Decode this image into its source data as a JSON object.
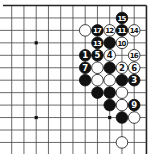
{
  "diagram": {
    "type": "go-board-fragment",
    "corner": "top-right",
    "columns": 12,
    "rows": 12,
    "grid": {
      "x0": 11.7,
      "dx": 12.25,
      "y0": 5.5,
      "dy": 12.45,
      "line_color": "#444444",
      "edge_color": "#222222"
    },
    "star_points": [
      {
        "col": 2,
        "row": 3
      },
      {
        "col": 2,
        "row": 9
      },
      {
        "col": 8,
        "row": 9
      }
    ],
    "stones": [
      {
        "col": 9,
        "row": 1,
        "color": "black",
        "label": "15"
      },
      {
        "col": 6,
        "row": 2,
        "color": "white",
        "label": ""
      },
      {
        "col": 7,
        "row": 2,
        "color": "black",
        "label": "17"
      },
      {
        "col": 8,
        "row": 2,
        "color": "white",
        "label": "12"
      },
      {
        "col": 9,
        "row": 2,
        "color": "black",
        "label": "11"
      },
      {
        "col": 10,
        "row": 2,
        "color": "white",
        "label": "14"
      },
      {
        "col": 7,
        "row": 3,
        "color": "black",
        "label": "13"
      },
      {
        "col": 8,
        "row": 3,
        "color": "black",
        "label": ""
      },
      {
        "col": 9,
        "row": 3,
        "color": "white",
        "label": "10"
      },
      {
        "col": 6,
        "row": 4,
        "color": "black",
        "label": "1"
      },
      {
        "col": 7,
        "row": 4,
        "color": "black",
        "label": "5"
      },
      {
        "col": 8,
        "row": 4,
        "color": "white",
        "label": "4"
      },
      {
        "col": 10,
        "row": 4,
        "color": "white",
        "label": "16"
      },
      {
        "col": 6,
        "row": 5,
        "color": "black",
        "label": "7"
      },
      {
        "col": 7,
        "row": 5,
        "color": "white",
        "label": ""
      },
      {
        "col": 8,
        "row": 5,
        "color": "black",
        "label": ""
      },
      {
        "col": 9,
        "row": 5,
        "color": "white",
        "label": "2"
      },
      {
        "col": 10,
        "row": 5,
        "color": "white",
        "label": "6"
      },
      {
        "col": 6,
        "row": 6,
        "color": "black",
        "label": ""
      },
      {
        "col": 7,
        "row": 6,
        "color": "white",
        "label": ""
      },
      {
        "col": 8,
        "row": 6,
        "color": "white",
        "label": ""
      },
      {
        "col": 9,
        "row": 6,
        "color": "black",
        "label": ""
      },
      {
        "col": 10,
        "row": 6,
        "color": "black",
        "label": "3"
      },
      {
        "col": 7,
        "row": 7,
        "color": "black",
        "label": ""
      },
      {
        "col": 8,
        "row": 7,
        "color": "black",
        "label": ""
      },
      {
        "col": 9,
        "row": 7,
        "color": "white",
        "label": ""
      },
      {
        "col": 8,
        "row": 8,
        "color": "black",
        "label": ""
      },
      {
        "col": 9,
        "row": 8,
        "color": "white",
        "label": ""
      },
      {
        "col": 10,
        "row": 8,
        "color": "black",
        "label": "9"
      },
      {
        "col": 9,
        "row": 9,
        "color": "black",
        "label": ""
      },
      {
        "col": 10,
        "row": 9,
        "color": "white",
        "label": ""
      },
      {
        "col": 9,
        "row": 11,
        "color": "white",
        "label": ""
      }
    ]
  }
}
